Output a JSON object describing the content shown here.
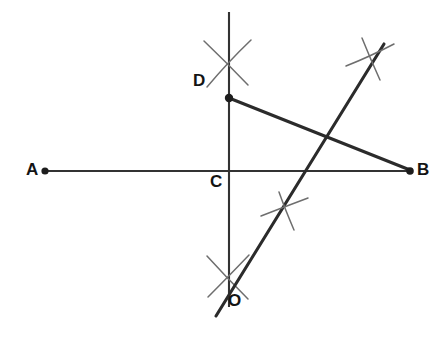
{
  "figure": {
    "background_color": "#ffffff",
    "line_color": "#2b2b2b",
    "arc_color": "#6e6e6e",
    "label_color": "#141414",
    "width": 438,
    "height": 344
  },
  "labels": {
    "A": "A",
    "B": "B",
    "C": "C",
    "D": "D",
    "O": "O"
  },
  "points": [
    {
      "name": "A",
      "label": "A",
      "x": 45,
      "y": 171,
      "dot": true
    },
    {
      "name": "B",
      "label": "B",
      "x": 410,
      "y": 171,
      "dot": true
    },
    {
      "name": "C",
      "label": "C",
      "x": 229,
      "y": 171,
      "dot": false
    },
    {
      "name": "D",
      "label": "D",
      "x": 229,
      "y": 98,
      "dot": true
    },
    {
      "name": "O",
      "label": "O",
      "x": 222,
      "y": 300,
      "dot": false
    }
  ],
  "segments": [
    {
      "name": "segment-AB",
      "from": "A",
      "to": "B",
      "x1": 45,
      "y1": 171,
      "x2": 410,
      "y2": 171,
      "style": "thin"
    },
    {
      "name": "segment-DB",
      "from": "D",
      "to": "B",
      "x1": 229,
      "y1": 98,
      "x2": 410,
      "y2": 170,
      "style": "thick"
    },
    {
      "name": "vertical-line-through-C",
      "from": "top",
      "to": "bottom",
      "x1": 229,
      "y1": 12,
      "x2": 229,
      "y2": 307,
      "style": "thin"
    },
    {
      "name": "diagonal-line-O-to-upper-right",
      "from": "O",
      "to": "upper-right",
      "x1": 216,
      "y1": 316,
      "x2": 384,
      "y2": 44,
      "style": "thick"
    }
  ],
  "arc_marks": [
    {
      "name": "arc-cross-above-D",
      "cx": 228,
      "cy": 61,
      "note": "compass arc intersection above point D"
    },
    {
      "name": "arc-cross-below-C",
      "cx": 227,
      "cy": 278,
      "note": "compass arc intersection below point C near O"
    },
    {
      "name": "arc-cross-on-diagonal-lower",
      "cx": 285,
      "cy": 208,
      "note": "compass arc intersection on diagonal line, lower right of C"
    },
    {
      "name": "arc-cross-on-diagonal-upper",
      "cx": 369,
      "cy": 57,
      "note": "compass arc intersection on diagonal line, upper right"
    }
  ]
}
